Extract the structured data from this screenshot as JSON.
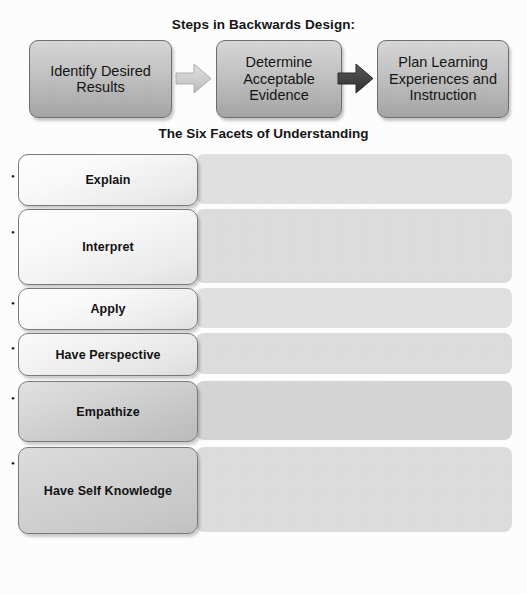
{
  "diagram": {
    "title": "Steps in Backwards Design:",
    "steps": [
      {
        "label": "Identify Desired Results",
        "icon": "rounded-box"
      },
      {
        "label": "Determine Acceptable Evidence",
        "icon": "rounded-box"
      },
      {
        "label": "Plan Learning Experiences and Instruction",
        "icon": "rounded-box"
      }
    ],
    "arrows": [
      {
        "name": "arrow-right-light",
        "color": "#c9c9c9"
      },
      {
        "name": "arrow-right-dark",
        "color": "#4a4a4a"
      }
    ]
  },
  "facets": {
    "title": "The Six Facets of Understanding",
    "rows": [
      {
        "label": "Explain",
        "description": "Provide thorough and justifiable accounts of phenomena, facts, and data.",
        "bullet": "•"
      },
      {
        "label": "Interpret",
        "description": "Tell meaningful stories, offer apt translations, provide a revealing historical or personal dimension to ideas and events; make subjects personal or accessible through images, anecdotes, analogies, and models.",
        "bullet": "•"
      },
      {
        "label": "Apply",
        "description": "Effectively use and adapt what they know in diverse contexts.",
        "bullet": "•"
      },
      {
        "label": "Have Perspective",
        "description": "See and hear points of view through critical eyes and ears; see the big picture.",
        "bullet": "•"
      },
      {
        "label": "Empathize",
        "description": "Find value in what others might find odd, alien, or implausible; perceive sensitively on the basis of prior indirect experience.",
        "bullet": "•"
      },
      {
        "label": "Have Self Knowledge",
        "description": "Perceive the personal style, prejudices, projections, and habits of mind that both shape and impede their own understanding; be aware of what they do not understand and why understanding is so hard.",
        "bullet": "•"
      }
    ]
  },
  "colors": {
    "page_background": "#ffffff",
    "panel_grey": "#dcdcdc",
    "box_border": "#6e6e6e",
    "text": "#141414"
  }
}
